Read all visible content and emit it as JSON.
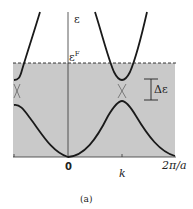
{
  "figure": {
    "caption": "(a)",
    "y_axis_label": "ε",
    "fermi_label": "ε",
    "fermi_superscript": "F",
    "gap_label": "Δε",
    "x_ticks": [
      {
        "label": "0"
      },
      {
        "label": "k"
      },
      {
        "label": "2π/a"
      }
    ],
    "colors": {
      "filled_region": "#c8c8c8",
      "curve": "#1a1a1a",
      "background": "#ffffff"
    }
  }
}
